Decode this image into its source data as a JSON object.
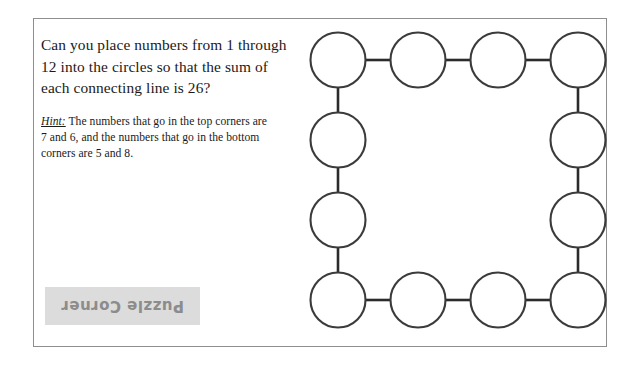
{
  "page": {
    "background_color": "#ffffff",
    "width": 637,
    "height": 367
  },
  "frame": {
    "border_color": "#8e8e8e"
  },
  "question": {
    "text": "Can you place numbers from 1 through 12 into the circles so that the sum of each connecting line is 26?"
  },
  "hint": {
    "label": "Hint:",
    "text": " The numbers that go in the top corners are 7 and 6, and the numbers that go in the bottom corners are 5 and 8."
  },
  "watermark": {
    "text": "Puzzle Corner",
    "box_color": "#dcdcdc",
    "text_color": "#8c8c8c",
    "rotation_degrees": 180
  },
  "diagram": {
    "circle_count": 12,
    "circle_radius": 27.5,
    "circle_fill": "#ffffff",
    "circle_stroke": "#3b3b3b",
    "link_stroke": "#2b2b2b",
    "circles": [
      {
        "id": "top-left-corner",
        "cx": 43,
        "cy": 42,
        "label": ""
      },
      {
        "id": "top-edge-1",
        "cx": 123,
        "cy": 42,
        "label": ""
      },
      {
        "id": "top-edge-2",
        "cx": 203,
        "cy": 42,
        "label": ""
      },
      {
        "id": "top-right-corner",
        "cx": 283,
        "cy": 42,
        "label": ""
      },
      {
        "id": "right-edge-1",
        "cx": 283,
        "cy": 122,
        "label": ""
      },
      {
        "id": "right-edge-2",
        "cx": 283,
        "cy": 202,
        "label": ""
      },
      {
        "id": "bottom-right-corner",
        "cx": 283,
        "cy": 282,
        "label": ""
      },
      {
        "id": "bottom-edge-2",
        "cx": 203,
        "cy": 282,
        "label": ""
      },
      {
        "id": "bottom-edge-1",
        "cx": 123,
        "cy": 282,
        "label": ""
      },
      {
        "id": "bottom-left-corner",
        "cx": 43,
        "cy": 282,
        "label": ""
      },
      {
        "id": "left-edge-2",
        "cx": 43,
        "cy": 202,
        "label": ""
      },
      {
        "id": "left-edge-1",
        "cx": 43,
        "cy": 122,
        "label": ""
      }
    ],
    "links": [
      {
        "id": "link-top-1",
        "x1": 70.5,
        "y1": 42,
        "x2": 95.5,
        "y2": 42
      },
      {
        "id": "link-top-2",
        "x1": 150.5,
        "y1": 42,
        "x2": 175.5,
        "y2": 42
      },
      {
        "id": "link-top-3",
        "x1": 230.5,
        "y1": 42,
        "x2": 255.5,
        "y2": 42
      },
      {
        "id": "link-right-1",
        "x1": 283,
        "y1": 69.5,
        "x2": 283,
        "y2": 94.5
      },
      {
        "id": "link-right-2",
        "x1": 283,
        "y1": 149.5,
        "x2": 283,
        "y2": 174.5
      },
      {
        "id": "link-right-3",
        "x1": 283,
        "y1": 229.5,
        "x2": 283,
        "y2": 254.5
      },
      {
        "id": "link-bottom-3",
        "x1": 230.5,
        "y1": 282,
        "x2": 255.5,
        "y2": 282
      },
      {
        "id": "link-bottom-2",
        "x1": 150.5,
        "y1": 282,
        "x2": 175.5,
        "y2": 282
      },
      {
        "id": "link-bottom-1",
        "x1": 70.5,
        "y1": 282,
        "x2": 95.5,
        "y2": 282
      },
      {
        "id": "link-left-3",
        "x1": 43,
        "y1": 229.5,
        "x2": 43,
        "y2": 254.5
      },
      {
        "id": "link-left-2",
        "x1": 43,
        "y1": 149.5,
        "x2": 43,
        "y2": 174.5
      },
      {
        "id": "link-left-1",
        "x1": 43,
        "y1": 69.5,
        "x2": 43,
        "y2": 94.5
      }
    ]
  }
}
